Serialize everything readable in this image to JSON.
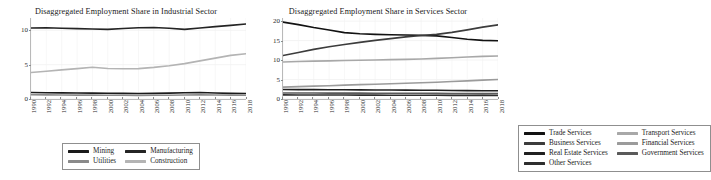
{
  "figure": {
    "background_color": "#ffffff",
    "axis_color": "#b9b9b9",
    "text_color": "#1a1a1a"
  },
  "panels": [
    {
      "id": "industrial",
      "title": "Disaggregated Employment Share in Industrial Sector"
    },
    {
      "id": "services",
      "title": "Disaggregated Employment Share in Services Sector"
    }
  ],
  "legends": {
    "industrial": {
      "items": [
        {
          "label": "Mining",
          "color": "#1a1a1a"
        },
        {
          "label": "Utilities",
          "color": "#8a8a8a"
        },
        {
          "label": "Manufacturing",
          "color": "#242424"
        },
        {
          "label": "Construction",
          "color": "#b4b4b4"
        }
      ]
    },
    "services": {
      "items": [
        {
          "label": "Trade Services",
          "color": "#121212"
        },
        {
          "label": "Business Services",
          "color": "#3c3c3c"
        },
        {
          "label": "Real Estate Services",
          "color": "#202020"
        },
        {
          "label": "Other Services",
          "color": "#2e2e2e"
        },
        {
          "label": "Transport Services",
          "color": "#a8a8a8"
        },
        {
          "label": "Financial Services",
          "color": "#9b9b9b"
        },
        {
          "label": "Government Services",
          "color": "#5a5a5a"
        }
      ]
    }
  },
  "chart_data": [
    {
      "type": "line",
      "id": "industrial",
      "title": "Disaggregated Employment Share in Industrial Sector",
      "xlabel": "",
      "ylabel": "",
      "grid": true,
      "legend_position": "bottom",
      "x": [
        1990,
        1992,
        1994,
        1996,
        1998,
        2000,
        2002,
        2004,
        2006,
        2008,
        2010,
        2012,
        2014,
        2016,
        2018
      ],
      "xticklabels": [
        "1990",
        "1992",
        "1994",
        "1996",
        "1998",
        "2000",
        "2002",
        "2004",
        "2006",
        "2008",
        "2010",
        "2012",
        "2014",
        "2016",
        "2018"
      ],
      "ylim": [
        0,
        11.8
      ],
      "yticks": [
        0,
        5,
        10
      ],
      "yticklabels": [
        "0",
        "5",
        "10"
      ],
      "series": [
        {
          "name": "Mining",
          "color": "#1a1a1a",
          "values": [
            0.95,
            0.92,
            0.9,
            0.88,
            0.86,
            0.84,
            0.82,
            0.8,
            0.82,
            0.86,
            0.92,
            0.95,
            0.88,
            0.82,
            0.8
          ]
        },
        {
          "name": "Utilities",
          "color": "#8a8a8a",
          "values": [
            0.62,
            0.6,
            0.58,
            0.57,
            0.56,
            0.55,
            0.54,
            0.53,
            0.54,
            0.55,
            0.58,
            0.6,
            0.58,
            0.56,
            0.55
          ]
        },
        {
          "name": "Manufacturing",
          "color": "#242424",
          "values": [
            10.35,
            10.38,
            10.3,
            10.25,
            10.2,
            10.15,
            10.28,
            10.38,
            10.42,
            10.3,
            10.15,
            10.35,
            10.55,
            10.72,
            10.92
          ]
        },
        {
          "name": "Construction",
          "color": "#b4b4b4",
          "values": [
            3.85,
            4.05,
            4.25,
            4.42,
            4.62,
            4.45,
            4.4,
            4.42,
            4.6,
            4.85,
            5.15,
            5.55,
            5.95,
            6.35,
            6.6
          ]
        }
      ]
    },
    {
      "type": "line",
      "id": "services",
      "title": "Disaggregated Employment Share in Services Sector",
      "xlabel": "",
      "ylabel": "",
      "grid": true,
      "legend_position": "bottom",
      "x": [
        1990,
        1992,
        1994,
        1996,
        1998,
        2000,
        2002,
        2004,
        2006,
        2008,
        2010,
        2012,
        2014,
        2016,
        2018
      ],
      "xticklabels": [
        "1990",
        "1992",
        "1994",
        "1996",
        "1998",
        "2000",
        "2002",
        "2004",
        "2006",
        "2008",
        "2010",
        "2012",
        "2014",
        "2016",
        "2018"
      ],
      "ylim": [
        0,
        20.8
      ],
      "yticks": [
        0,
        5,
        10,
        15,
        20
      ],
      "yticklabels": [
        "0",
        "5",
        "10",
        "15",
        "20"
      ],
      "series": [
        {
          "name": "Trade Services",
          "color": "#121212",
          "values": [
            19.75,
            19.1,
            18.35,
            17.7,
            17.05,
            16.75,
            16.6,
            16.5,
            16.42,
            16.35,
            16.2,
            15.8,
            15.35,
            15.05,
            14.95
          ]
        },
        {
          "name": "Business Services",
          "color": "#3c3c3c",
          "values": [
            11.15,
            11.95,
            12.75,
            13.4,
            14.0,
            14.55,
            15.05,
            15.5,
            15.95,
            16.3,
            16.6,
            17.1,
            17.75,
            18.45,
            19.05
          ]
        },
        {
          "name": "Transport Services",
          "color": "#a8a8a8",
          "values": [
            9.5,
            9.62,
            9.72,
            9.8,
            9.88,
            9.95,
            10.02,
            10.1,
            10.18,
            10.28,
            10.42,
            10.6,
            10.78,
            10.95,
            11.05
          ]
        },
        {
          "name": "Financial Services",
          "color": "#9b9b9b",
          "values": [
            3.05,
            3.18,
            3.3,
            3.42,
            3.55,
            3.68,
            3.8,
            3.92,
            4.05,
            4.18,
            4.32,
            4.48,
            4.65,
            4.85,
            5.0
          ]
        },
        {
          "name": "Real Estate Services",
          "color": "#202020",
          "values": [
            2.45,
            2.42,
            2.4,
            2.38,
            2.36,
            2.34,
            2.32,
            2.3,
            2.28,
            2.26,
            2.24,
            2.2,
            2.16,
            2.12,
            2.1
          ]
        },
        {
          "name": "Government Services",
          "color": "#5a5a5a",
          "values": [
            1.55,
            1.54,
            1.53,
            1.52,
            1.51,
            1.5,
            1.49,
            1.48,
            1.47,
            1.46,
            1.45,
            1.43,
            1.41,
            1.39,
            1.38
          ]
        },
        {
          "name": "Other Services",
          "color": "#2e2e2e",
          "values": [
            1.05,
            1.04,
            1.03,
            1.02,
            1.01,
            1.0,
            0.99,
            0.98,
            0.97,
            0.96,
            0.95,
            0.94,
            0.93,
            0.92,
            0.91
          ]
        }
      ]
    }
  ]
}
